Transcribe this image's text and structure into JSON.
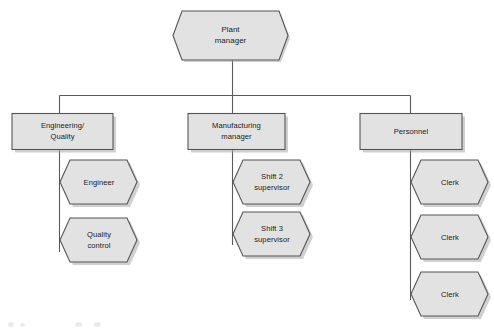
{
  "diagram": {
    "type": "organization-chart",
    "background_color": "#ffffff",
    "node_fill_color": "#e2e2e2",
    "node_stroke_color": "#555555",
    "connector_color": "#5a5a5a",
    "text_color": "#1b1b1b"
  },
  "nodes": {
    "root": {
      "id": "plant-manager",
      "shape": "hexagon",
      "line1": "Plant",
      "line2": "manager"
    },
    "departments": [
      {
        "id": "engineering-quality",
        "shape": "rectangle",
        "line1": "Engineering/",
        "line2": "Quality"
      },
      {
        "id": "manufacturing-manager",
        "shape": "rectangle",
        "line1": "Manufacturing",
        "line2": "manager"
      },
      {
        "id": "personnel",
        "shape": "rectangle",
        "line1": "Personnel",
        "line2": ""
      }
    ],
    "staff": {
      "engineering_quality": [
        {
          "id": "engineer",
          "shape": "hexagon",
          "line1": "Engineer",
          "line2": ""
        },
        {
          "id": "quality-control",
          "shape": "hexagon",
          "line1": "Quality",
          "line2": "control"
        }
      ],
      "manufacturing": [
        {
          "id": "shift-2-supervisor",
          "shape": "hexagon",
          "line1": "Shift 2",
          "line2": "supervisor"
        },
        {
          "id": "shift-3-supervisor",
          "shape": "hexagon",
          "line1": "Shift 3",
          "line2": "supervisor"
        }
      ],
      "personnel": [
        {
          "id": "clerk-1",
          "shape": "hexagon",
          "line1": "Clerk",
          "line2": ""
        },
        {
          "id": "clerk-2",
          "shape": "hexagon",
          "line1": "Clerk",
          "line2": ""
        },
        {
          "id": "clerk-3",
          "shape": "hexagon",
          "line1": "Clerk",
          "line2": ""
        }
      ]
    }
  }
}
